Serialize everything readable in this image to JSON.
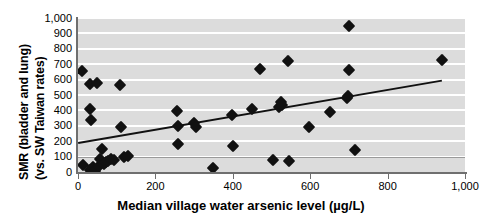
{
  "chart_data": {
    "type": "scatter",
    "title": "",
    "xlabel": "Median village water arsenic level (µg/L)",
    "ylabel_line1": "SMR (bladder and lung)",
    "ylabel_line2": "(vs. SW Taiwan rates)",
    "xlim": [
      0,
      1000
    ],
    "ylim": [
      0,
      1000
    ],
    "xticks": [
      0,
      200,
      400,
      600,
      800,
      1000
    ],
    "xtick_labels": [
      "0",
      "200",
      "400",
      "600",
      "800",
      "1,000"
    ],
    "yticks": [
      0,
      100,
      200,
      300,
      400,
      500,
      600,
      700,
      800,
      900,
      1000
    ],
    "ytick_labels": [
      "0",
      "100",
      "200",
      "300",
      "400",
      "500",
      "600",
      "700",
      "800",
      "900",
      "1,000"
    ],
    "grid": "horizontal-white-on-gray",
    "legend": "none",
    "plot_bgcolor": "#dcdcdc",
    "gridline_color": "#ffffff",
    "marker_color": "#111111",
    "marker_shape": "diamond",
    "trendline_color": "#111111",
    "reference_line": {
      "y": 100,
      "color": "#9a9a9a",
      "label": ""
    },
    "trendline": {
      "x": [
        0,
        940
      ],
      "y": [
        195,
        600
      ]
    },
    "points": [
      {
        "x": 10,
        "y": 655
      },
      {
        "x": 12,
        "y": 45
      },
      {
        "x": 30,
        "y": 570
      },
      {
        "x": 32,
        "y": 410
      },
      {
        "x": 33,
        "y": 340
      },
      {
        "x": 30,
        "y": 10
      },
      {
        "x": 36,
        "y": 20
      },
      {
        "x": 40,
        "y": 30
      },
      {
        "x": 45,
        "y": 5
      },
      {
        "x": 50,
        "y": 580
      },
      {
        "x": 55,
        "y": 40
      },
      {
        "x": 58,
        "y": 85
      },
      {
        "x": 62,
        "y": 148
      },
      {
        "x": 68,
        "y": 55
      },
      {
        "x": 72,
        "y": 62
      },
      {
        "x": 78,
        "y": 70
      },
      {
        "x": 86,
        "y": 85
      },
      {
        "x": 92,
        "y": 80
      },
      {
        "x": 108,
        "y": 565
      },
      {
        "x": 110,
        "y": 292
      },
      {
        "x": 120,
        "y": 100
      },
      {
        "x": 128,
        "y": 103
      },
      {
        "x": 255,
        "y": 398
      },
      {
        "x": 258,
        "y": 300
      },
      {
        "x": 258,
        "y": 185
      },
      {
        "x": 300,
        "y": 318
      },
      {
        "x": 305,
        "y": 295
      },
      {
        "x": 350,
        "y": 25
      },
      {
        "x": 398,
        "y": 368
      },
      {
        "x": 400,
        "y": 168
      },
      {
        "x": 450,
        "y": 408
      },
      {
        "x": 470,
        "y": 668
      },
      {
        "x": 505,
        "y": 78
      },
      {
        "x": 520,
        "y": 420
      },
      {
        "x": 525,
        "y": 455
      },
      {
        "x": 528,
        "y": 438
      },
      {
        "x": 542,
        "y": 718
      },
      {
        "x": 545,
        "y": 70
      },
      {
        "x": 598,
        "y": 295
      },
      {
        "x": 650,
        "y": 388
      },
      {
        "x": 695,
        "y": 480
      },
      {
        "x": 698,
        "y": 495
      },
      {
        "x": 700,
        "y": 950
      },
      {
        "x": 700,
        "y": 660
      },
      {
        "x": 715,
        "y": 145
      },
      {
        "x": 940,
        "y": 725
      }
    ]
  }
}
